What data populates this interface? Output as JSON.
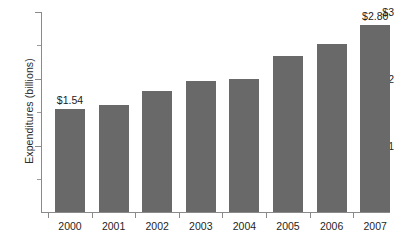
{
  "chart_data": {
    "type": "bar",
    "title": "",
    "subtitle": "",
    "xlabel": "",
    "ylabel": "Expenditures (billions)",
    "categories": [
      "2000",
      "2001",
      "2002",
      "2003",
      "2004",
      "2005",
      "2006",
      "2007"
    ],
    "values": [
      1.54,
      1.6,
      1.81,
      1.96,
      1.99,
      2.34,
      2.51,
      2.8
    ],
    "data_labels": [
      "$1.54",
      "",
      "",
      "",
      "",
      "",
      "",
      "$2.80"
    ],
    "ylim": [
      0,
      3
    ],
    "y_tick_values": [
      1,
      2,
      3
    ],
    "y_tick_labels": [
      "$1",
      "$2",
      "$3"
    ],
    "y_minor_tick_values": [
      0.5,
      1.5,
      2.5
    ],
    "grid": false,
    "legend": null,
    "bar_color": "#696969",
    "axis_color": "#8a8a8a",
    "text_color": "#1f1f1f"
  }
}
